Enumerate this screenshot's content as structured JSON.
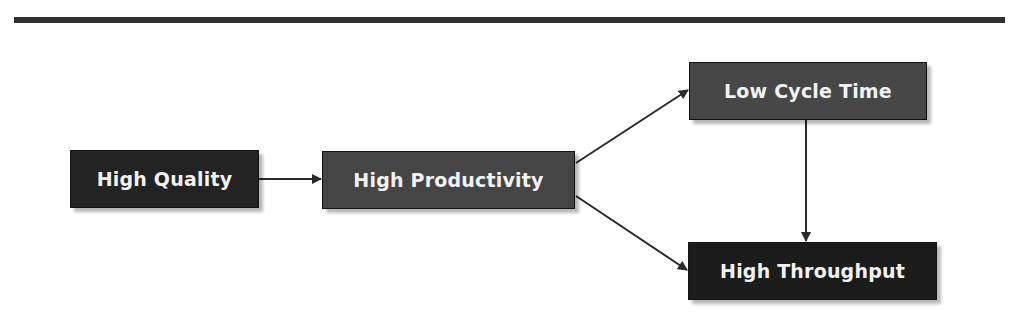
{
  "diagram": {
    "type": "flowchart",
    "nodes": [
      {
        "id": "hq",
        "label": "High Quality",
        "fill": "#232323"
      },
      {
        "id": "hp",
        "label": "High Productivity",
        "fill": "#454545"
      },
      {
        "id": "lct",
        "label": "Low Cycle Time",
        "fill": "#474747"
      },
      {
        "id": "ht",
        "label": "High Throughput",
        "fill": "#1c1c1c"
      }
    ],
    "edges": [
      {
        "from": "hq",
        "to": "hp"
      },
      {
        "from": "hp",
        "to": "lct"
      },
      {
        "from": "hp",
        "to": "ht"
      },
      {
        "from": "lct",
        "to": "ht"
      }
    ],
    "rule_color": "#2f2f2f",
    "text_color": "#f2f2f2"
  }
}
